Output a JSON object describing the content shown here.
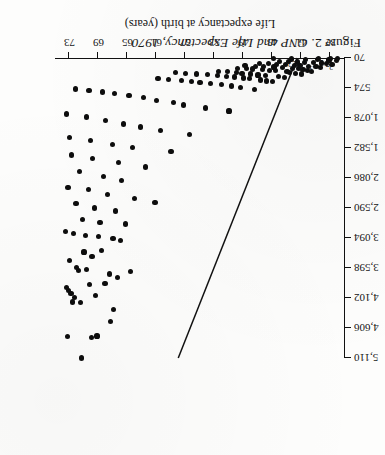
{
  "figure": {
    "caption_lead": "Figure 2.",
    "caption_title": "GNP and Life Expectancy, 1970"
  },
  "chart_data": {
    "type": "scatter",
    "title": "GNP and Life Expectancy, 1970",
    "xlabel": "Life expectancy at birth (years)",
    "ylabel": "GNP per head (1970 U.S. dollars)",
    "xlim": [
      35,
      75
    ],
    "ylim": [
      70,
      5110
    ],
    "grid": false,
    "legend": "none",
    "xticks": [
      37,
      41,
      45,
      49,
      53,
      57,
      61,
      65,
      69,
      73
    ],
    "xticklabels": [
      "37",
      "41",
      "45",
      "49",
      "53",
      "57",
      "61",
      "65",
      "69",
      "73"
    ],
    "yticks": [
      70,
      574,
      1078,
      1582,
      2086,
      2590,
      3094,
      3598,
      4102,
      4606,
      5110
    ],
    "yticklabels": [
      "70",
      "574",
      "1,078",
      "1,582",
      "2,086",
      "2,590",
      "3,094",
      "3,598",
      "4,102",
      "4,606",
      "5,110"
    ],
    "points": [
      {
        "x": 71.3,
        "y": 5110
      },
      {
        "x": 70.0,
        "y": 4760
      },
      {
        "x": 69.2,
        "y": 4740
      },
      {
        "x": 73.3,
        "y": 4750
      },
      {
        "x": 67.3,
        "y": 4500
      },
      {
        "x": 66.9,
        "y": 4300
      },
      {
        "x": 71.5,
        "y": 4180
      },
      {
        "x": 72.6,
        "y": 4170
      },
      {
        "x": 72.3,
        "y": 4090
      },
      {
        "x": 69.4,
        "y": 4060
      },
      {
        "x": 72.8,
        "y": 4020
      },
      {
        "x": 73.1,
        "y": 3980
      },
      {
        "x": 73.4,
        "y": 3930
      },
      {
        "x": 70.2,
        "y": 3880
      },
      {
        "x": 68.1,
        "y": 3860
      },
      {
        "x": 66.4,
        "y": 3760
      },
      {
        "x": 67.5,
        "y": 3700
      },
      {
        "x": 64.6,
        "y": 3660
      },
      {
        "x": 71.8,
        "y": 3640
      },
      {
        "x": 70.6,
        "y": 3620
      },
      {
        "x": 72.0,
        "y": 3590
      },
      {
        "x": 73.0,
        "y": 3470
      },
      {
        "x": 69.9,
        "y": 3400
      },
      {
        "x": 71.0,
        "y": 3330
      },
      {
        "x": 68.6,
        "y": 3300
      },
      {
        "x": 66.0,
        "y": 3140
      },
      {
        "x": 67.0,
        "y": 3100
      },
      {
        "x": 69.0,
        "y": 3070
      },
      {
        "x": 70.8,
        "y": 3050
      },
      {
        "x": 72.4,
        "y": 3020
      },
      {
        "x": 73.5,
        "y": 2990
      },
      {
        "x": 65.3,
        "y": 2860
      },
      {
        "x": 68.8,
        "y": 2830
      },
      {
        "x": 71.2,
        "y": 2780
      },
      {
        "x": 66.6,
        "y": 2640
      },
      {
        "x": 69.6,
        "y": 2590
      },
      {
        "x": 72.1,
        "y": 2520
      },
      {
        "x": 61.2,
        "y": 2500
      },
      {
        "x": 64.0,
        "y": 2430
      },
      {
        "x": 67.8,
        "y": 2360
      },
      {
        "x": 70.4,
        "y": 2280
      },
      {
        "x": 73.2,
        "y": 2240
      },
      {
        "x": 65.8,
        "y": 2130
      },
      {
        "x": 68.3,
        "y": 2060
      },
      {
        "x": 71.6,
        "y": 1980
      },
      {
        "x": 62.5,
        "y": 1900
      },
      {
        "x": 66.2,
        "y": 1830
      },
      {
        "x": 69.8,
        "y": 1760
      },
      {
        "x": 72.7,
        "y": 1700
      },
      {
        "x": 59.0,
        "y": 1640
      },
      {
        "x": 64.3,
        "y": 1580
      },
      {
        "x": 67.1,
        "y": 1520
      },
      {
        "x": 70.1,
        "y": 1460
      },
      {
        "x": 73.0,
        "y": 1400
      },
      {
        "x": 56.4,
        "y": 1350
      },
      {
        "x": 60.5,
        "y": 1290
      },
      {
        "x": 63.2,
        "y": 1230
      },
      {
        "x": 65.6,
        "y": 1180
      },
      {
        "x": 68.0,
        "y": 1120
      },
      {
        "x": 70.7,
        "y": 1060
      },
      {
        "x": 73.4,
        "y": 1010
      },
      {
        "x": 51.0,
        "y": 960
      },
      {
        "x": 54.2,
        "y": 910
      },
      {
        "x": 57.3,
        "y": 860
      },
      {
        "x": 58.6,
        "y": 820
      },
      {
        "x": 61.0,
        "y": 780
      },
      {
        "x": 62.8,
        "y": 740
      },
      {
        "x": 64.8,
        "y": 700
      },
      {
        "x": 66.8,
        "y": 670
      },
      {
        "x": 68.5,
        "y": 640
      },
      {
        "x": 70.3,
        "y": 610
      },
      {
        "x": 72.2,
        "y": 590
      },
      {
        "x": 47.5,
        "y": 600
      },
      {
        "x": 49.4,
        "y": 560
      },
      {
        "x": 50.6,
        "y": 540
      },
      {
        "x": 52.0,
        "y": 520
      },
      {
        "x": 53.5,
        "y": 500
      },
      {
        "x": 55.0,
        "y": 480
      },
      {
        "x": 56.2,
        "y": 460
      },
      {
        "x": 57.6,
        "y": 450
      },
      {
        "x": 59.3,
        "y": 430
      },
      {
        "x": 60.8,
        "y": 420
      },
      {
        "x": 45.0,
        "y": 470
      },
      {
        "x": 45.8,
        "y": 455
      },
      {
        "x": 46.6,
        "y": 440
      },
      {
        "x": 48.2,
        "y": 420
      },
      {
        "x": 49.0,
        "y": 405
      },
      {
        "x": 50.2,
        "y": 390
      },
      {
        "x": 51.4,
        "y": 375
      },
      {
        "x": 52.6,
        "y": 360
      },
      {
        "x": 54.0,
        "y": 350
      },
      {
        "x": 55.5,
        "y": 340
      },
      {
        "x": 57.0,
        "y": 330
      },
      {
        "x": 58.4,
        "y": 320
      },
      {
        "x": 43.4,
        "y": 400
      },
      {
        "x": 44.2,
        "y": 385
      },
      {
        "x": 46.0,
        "y": 370
      },
      {
        "x": 47.0,
        "y": 355
      },
      {
        "x": 48.0,
        "y": 340
      },
      {
        "x": 49.2,
        "y": 325
      },
      {
        "x": 50.0,
        "y": 310
      },
      {
        "x": 51.2,
        "y": 300
      },
      {
        "x": 52.4,
        "y": 290
      },
      {
        "x": 41.0,
        "y": 340
      },
      {
        "x": 41.8,
        "y": 325
      },
      {
        "x": 42.6,
        "y": 310
      },
      {
        "x": 43.0,
        "y": 295
      },
      {
        "x": 44.6,
        "y": 285
      },
      {
        "x": 45.4,
        "y": 275
      },
      {
        "x": 46.4,
        "y": 265
      },
      {
        "x": 47.8,
        "y": 255
      },
      {
        "x": 48.6,
        "y": 248
      },
      {
        "x": 49.8,
        "y": 240
      },
      {
        "x": 39.6,
        "y": 290
      },
      {
        "x": 40.2,
        "y": 275
      },
      {
        "x": 40.8,
        "y": 262
      },
      {
        "x": 41.4,
        "y": 250
      },
      {
        "x": 42.2,
        "y": 240
      },
      {
        "x": 43.6,
        "y": 230
      },
      {
        "x": 44.8,
        "y": 222
      },
      {
        "x": 46.2,
        "y": 215
      },
      {
        "x": 47.4,
        "y": 208
      },
      {
        "x": 48.8,
        "y": 200
      },
      {
        "x": 38.4,
        "y": 230
      },
      {
        "x": 39.0,
        "y": 218
      },
      {
        "x": 40.0,
        "y": 208
      },
      {
        "x": 41.2,
        "y": 198
      },
      {
        "x": 42.0,
        "y": 190
      },
      {
        "x": 43.2,
        "y": 182
      },
      {
        "x": 44.4,
        "y": 175
      },
      {
        "x": 45.6,
        "y": 168
      },
      {
        "x": 46.8,
        "y": 162
      },
      {
        "x": 36.8,
        "y": 175
      },
      {
        "x": 37.6,
        "y": 165
      },
      {
        "x": 38.2,
        "y": 155
      },
      {
        "x": 39.4,
        "y": 148
      },
      {
        "x": 40.6,
        "y": 142
      },
      {
        "x": 41.6,
        "y": 136
      },
      {
        "x": 42.8,
        "y": 130
      },
      {
        "x": 44.0,
        "y": 125
      },
      {
        "x": 36.2,
        "y": 115
      },
      {
        "x": 37.2,
        "y": 105
      },
      {
        "x": 38.8,
        "y": 98
      },
      {
        "x": 40.4,
        "y": 92
      },
      {
        "x": 42.4,
        "y": 86
      },
      {
        "x": 44.9,
        "y": 82
      },
      {
        "x": 36.0,
        "y": 76
      },
      {
        "x": 37.0,
        "y": 74
      },
      {
        "x": 38.6,
        "y": 73
      }
    ],
    "point_labels": [
      {
        "x": 36.9,
        "y": 205,
        "text": "2"
      },
      {
        "x": 37.4,
        "y": 148,
        "text": "7"
      },
      {
        "x": 38.3,
        "y": 143,
        "text": "2"
      },
      {
        "x": 39.7,
        "y": 240,
        "text": "3"
      },
      {
        "x": 41.1,
        "y": 222,
        "text": "3"
      },
      {
        "x": 41.9,
        "y": 160,
        "text": "2"
      },
      {
        "x": 42.6,
        "y": 155,
        "text": "3"
      }
    ],
    "fit_line": {
      "label": "fitted regression line",
      "x_start": 41.6,
      "y_start": 70,
      "x_end": 58.0,
      "y_end": 5110
    }
  }
}
